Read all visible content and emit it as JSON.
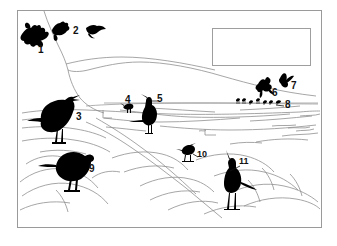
{
  "figure": {
    "type": "line-art-silhouette-plate",
    "title": "",
    "background_color": "#ffffff",
    "ink_color": "#000000",
    "line_color": "#8f8f8f",
    "frame": {
      "x": 17,
      "y": 10,
      "width": 305,
      "height": 218
    },
    "legend_box": {
      "x": 212,
      "y": 28,
      "width": 99,
      "height": 38,
      "content": ""
    },
    "scene": "coastal shoreline with rocks, water line and distant hills"
  },
  "labels": [
    {
      "id": "1",
      "text": "1",
      "x": 38,
      "y": 45,
      "size": "lg"
    },
    {
      "id": "2",
      "text": "2",
      "x": 73,
      "y": 26,
      "size": "lg"
    },
    {
      "id": "3",
      "text": "3",
      "x": 76,
      "y": 119,
      "size": "lg"
    },
    {
      "id": "4",
      "text": "4",
      "x": 126,
      "y": 96,
      "size": "lg"
    },
    {
      "id": "5",
      "text": "5",
      "x": 158,
      "y": 95,
      "size": "lg"
    },
    {
      "id": "6",
      "text": "6",
      "x": 272,
      "y": 89,
      "size": "lg"
    },
    {
      "id": "7",
      "text": "7",
      "x": 292,
      "y": 82,
      "size": "lg"
    },
    {
      "id": "8",
      "text": "8",
      "x": 285,
      "y": 105,
      "size": "lg"
    },
    {
      "id": "9",
      "text": "9",
      "x": 90,
      "y": 169,
      "size": "lg"
    },
    {
      "id": "10",
      "text": "10",
      "x": 198,
      "y": 153,
      "size": "md"
    },
    {
      "id": "11",
      "text": "11",
      "x": 240,
      "y": 161,
      "size": "md"
    }
  ],
  "birds": [
    {
      "number": "1",
      "name": "bird-silhouette-1",
      "posture": "flying-landing-flapping",
      "region": "upper-left-sky"
    },
    {
      "number": "2",
      "name": "bird-silhouette-2",
      "posture": "flying-gliding",
      "region": "upper-left-sky"
    },
    {
      "number": "3",
      "name": "bird-silhouette-3",
      "posture": "standing-crow-open-beak",
      "region": "left-foreground"
    },
    {
      "number": "4",
      "name": "bird-silhouette-4",
      "posture": "small-distant-wader",
      "region": "mid-waterline"
    },
    {
      "number": "5",
      "name": "bird-silhouette-5",
      "posture": "standing-upright-cormorant",
      "region": "mid-waterline"
    },
    {
      "number": "6",
      "name": "bird-silhouette-6",
      "posture": "flying-flapping",
      "region": "right-sky"
    },
    {
      "number": "7",
      "name": "bird-silhouette-7",
      "posture": "flying-gliding",
      "region": "right-sky"
    },
    {
      "number": "8",
      "name": "bird-flock-8",
      "posture": "row-of-distant-birds",
      "region": "right-waterline",
      "count": 7
    },
    {
      "number": "9",
      "name": "bird-silhouette-9",
      "posture": "standing-crow-on-rock",
      "region": "lower-left-rocks"
    },
    {
      "number": "10",
      "name": "bird-silhouette-10",
      "posture": "small-wader-standing",
      "region": "lower-middle"
    },
    {
      "number": "11",
      "name": "bird-silhouette-11",
      "posture": "long-billed-wader-standing",
      "region": "lower-right-rocks"
    }
  ]
}
